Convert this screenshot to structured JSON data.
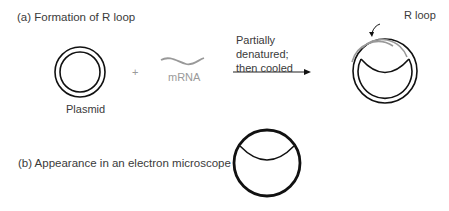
{
  "panel_a": {
    "title": "(a)  Formation of R loop",
    "plasmid_label": "Plasmid",
    "plus_sign": "+",
    "mrna_label": "mRNA",
    "arrow_label": "Partially\ndenatured;\nthen cooled",
    "rloop_label": "R loop"
  },
  "panel_b": {
    "title": "(b)  Appearance in an electron microscope"
  },
  "colors": {
    "dna": "#111111",
    "rna": "#999999",
    "text": "#3a3a3a"
  }
}
